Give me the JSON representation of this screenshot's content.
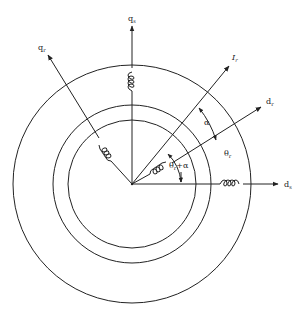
{
  "diagram": {
    "axes": [
      {
        "id": "ds",
        "label": "d",
        "subscript": "s"
      },
      {
        "id": "qs",
        "label": "q",
        "subscript": "s"
      },
      {
        "id": "dr",
        "label": "d",
        "subscript": "r"
      },
      {
        "id": "qr",
        "label": "q",
        "subscript": "r"
      },
      {
        "id": "Ir",
        "label": "I",
        "subscript": "r"
      }
    ],
    "angles": [
      {
        "id": "theta_r",
        "label": "θ",
        "subscript": "r"
      },
      {
        "id": "alpha",
        "label": "α"
      },
      {
        "id": "theta_r_plus_alpha",
        "label": "θ",
        "subscript": "r",
        "suffix": "+α"
      }
    ],
    "circles": [
      {
        "name": "outer-stator",
        "radius": 119
      },
      {
        "name": "middle-airgap",
        "radius": 79
      },
      {
        "name": "inner-rotor",
        "radius": 64
      }
    ],
    "coils": [
      "q-axis stator winding",
      "d-axis stator winding",
      "q-axis rotor winding",
      "d-axis rotor winding"
    ]
  }
}
